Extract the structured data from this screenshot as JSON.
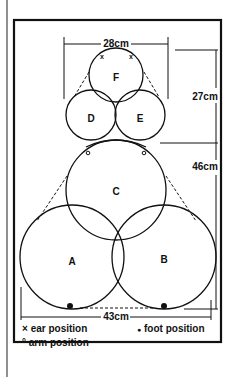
{
  "diagram": {
    "pieces": [
      {
        "id": "A",
        "label": "A",
        "cx": 72,
        "cy": 257,
        "r": 52
      },
      {
        "id": "B",
        "label": "B",
        "cx": 164,
        "cy": 257,
        "r": 52
      },
      {
        "id": "C",
        "label": "C",
        "cx": 116,
        "cy": 190,
        "r": 50
      },
      {
        "id": "D",
        "label": "D",
        "cx": 91,
        "cy": 115,
        "r": 25
      },
      {
        "id": "E",
        "label": "E",
        "cx": 140,
        "cy": 115,
        "r": 25
      },
      {
        "id": "F",
        "label": "F",
        "cx": 116,
        "cy": 75,
        "r": 27
      }
    ],
    "dimensions": {
      "head_width": "28cm",
      "head_height": "27cm",
      "body_height": "46cm",
      "base_width": "43cm"
    },
    "legend": {
      "ear": {
        "symbol": "×",
        "label": "ear position"
      },
      "arm": {
        "symbol": "°",
        "label": "arm position"
      },
      "foot": {
        "symbol": "●",
        "label": "foot position"
      }
    }
  }
}
